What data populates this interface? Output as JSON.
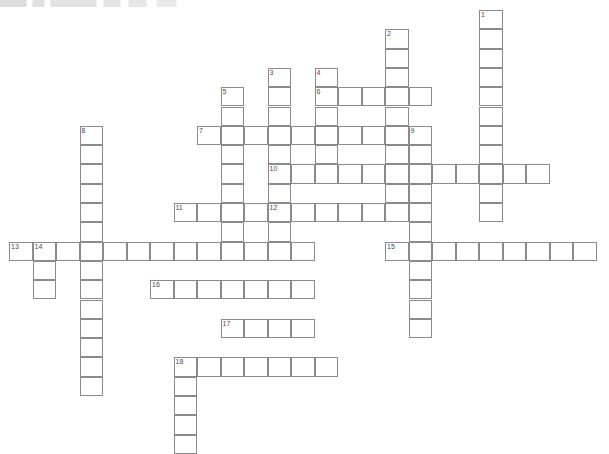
{
  "puzzle": {
    "kind": "crossword-grid",
    "title": "",
    "grid": {
      "origin_x": 9,
      "origin_y": 10,
      "cell_w": 23.5,
      "cell_h": 19.3,
      "cols": 25,
      "rows": 23,
      "line_color": "#8a8a8f",
      "cell_fill": "#ffffff",
      "number_color": "#4a4a50"
    },
    "entries": [
      {
        "number": "1",
        "direction": "down",
        "col": 20,
        "row": 0,
        "length": 11
      },
      {
        "number": "2",
        "direction": "down",
        "col": 16,
        "row": 1,
        "length": 9
      },
      {
        "number": "3",
        "direction": "down",
        "col": 11,
        "row": 3,
        "length": 9
      },
      {
        "number": "4",
        "direction": "down",
        "col": 13,
        "row": 3,
        "length": 5
      },
      {
        "number": "5",
        "direction": "down",
        "col": 9,
        "row": 4,
        "length": 8
      },
      {
        "number": "6",
        "direction": "across",
        "col": 13,
        "row": 4,
        "length": 5
      },
      {
        "number": "7",
        "direction": "across",
        "col": 8,
        "row": 6,
        "length": 9
      },
      {
        "number": "8",
        "direction": "down",
        "col": 3,
        "row": 6,
        "length": 14
      },
      {
        "number": "9",
        "direction": "down",
        "col": 17,
        "row": 6,
        "length": 11
      },
      {
        "number": "10",
        "direction": "across",
        "col": 11,
        "row": 8,
        "length": 12
      },
      {
        "number": "11",
        "direction": "across",
        "col": 7,
        "row": 10,
        "length": 4
      },
      {
        "number": "12",
        "direction": "across",
        "col": 11,
        "row": 10,
        "length": 6
      },
      {
        "number": "13",
        "direction": "across",
        "col": 0,
        "row": 12,
        "length": 13
      },
      {
        "number": "14",
        "direction": "down",
        "col": 1,
        "row": 12,
        "length": 3
      },
      {
        "number": "15",
        "direction": "across",
        "col": 16,
        "row": 12,
        "length": 9
      },
      {
        "number": "16",
        "direction": "across",
        "col": 6,
        "row": 14,
        "length": 7
      },
      {
        "number": "17",
        "direction": "across",
        "col": 9,
        "row": 16,
        "length": 4
      },
      {
        "number": "18",
        "direction": "across",
        "col": 7,
        "row": 18,
        "length": 7
      },
      {
        "number": "18",
        "direction": "down",
        "col": 7,
        "row": 18,
        "length": 5
      }
    ],
    "numbers_visible": [
      "1",
      "2",
      "3",
      "4",
      "5",
      "6",
      "7",
      "8",
      "9",
      "10",
      "11",
      "12",
      "13",
      "14",
      "15",
      "16",
      "17",
      "18"
    ],
    "letters": {}
  }
}
